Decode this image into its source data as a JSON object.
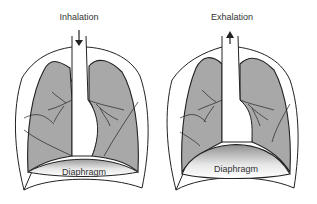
{
  "panels": [
    {
      "title": "Inhalation",
      "arrow": "down-arrow",
      "diaphragm_label": "Diaphragm",
      "diaphragm_state": "flat"
    },
    {
      "title": "Exhalation",
      "arrow": "up-arrow",
      "diaphragm_label": "Diaphragm",
      "diaphragm_state": "domed"
    }
  ],
  "colors": {
    "lung_fill": "#a8a8a8",
    "outline": "#222222",
    "background": "#ffffff"
  }
}
